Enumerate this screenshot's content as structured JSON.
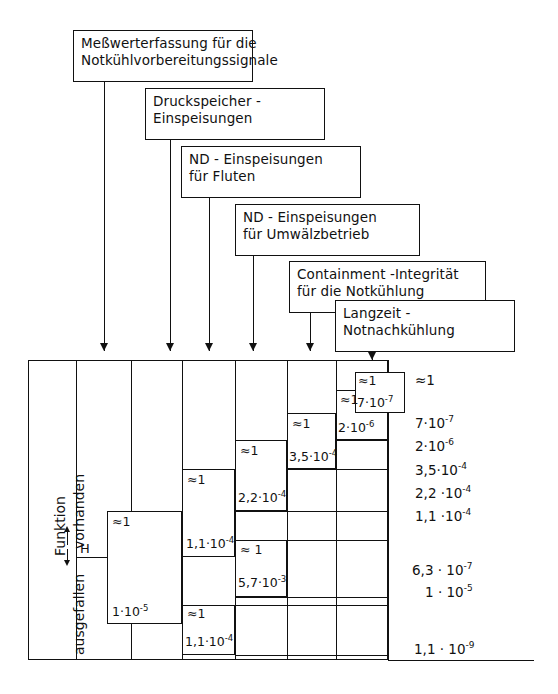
{
  "diagram": {
    "headers": [
      {
        "id": "messwerterfassung",
        "lines": [
          "Meßwerterfassung  für die",
          "Notkühlvorbereitungssignale"
        ]
      },
      {
        "id": "druckspeicher",
        "lines": [
          "Druckspeicher -",
          "Einspeisungen"
        ]
      },
      {
        "id": "nd-fluten",
        "lines": [
          "ND - Einspeisungen",
          "für  Fluten"
        ]
      },
      {
        "id": "nd-umwaelz",
        "lines": [
          "ND - Einspeisungen",
          "für  Umwälzbetrieb"
        ]
      },
      {
        "id": "containment",
        "lines": [
          "Containment -Integrität",
          "für  die  Notkühlung"
        ]
      },
      {
        "id": "langzeit",
        "lines": [
          "Langzeit -",
          "Notnachkühlung"
        ]
      }
    ],
    "axis_label": {
      "top_word": "Funktion",
      "up_word": "vorhanden",
      "down_word": "ausgefallen",
      "initiator": "H"
    },
    "branch_labels": [
      {
        "id": "b1-up",
        "text": "≈1"
      },
      {
        "id": "b1-down",
        "text": "1·10",
        "exp": "-5"
      },
      {
        "id": "b2-up",
        "text": "≈1"
      },
      {
        "id": "b2-down",
        "text": "1,1·10",
        "exp": "-4"
      },
      {
        "id": "b3-up",
        "text": "≈1"
      },
      {
        "id": "b3-down",
        "text": "2,2·10",
        "exp": "-4"
      },
      {
        "id": "b4-up",
        "text": "≈1"
      },
      {
        "id": "b4-down",
        "text": "3,5·10",
        "exp": "-4"
      },
      {
        "id": "b5-up",
        "text": "≈1"
      },
      {
        "id": "b5-down",
        "text": "2·10",
        "exp": "-6"
      },
      {
        "id": "b6-up",
        "text": "≈1"
      },
      {
        "id": "b6-down",
        "text": "7·10",
        "exp": "-7"
      },
      {
        "id": "b7-up",
        "text": "≈ 1"
      },
      {
        "id": "b7-down",
        "text": "5,7·10",
        "exp": "-3"
      },
      {
        "id": "b8-up",
        "text": "≈1"
      },
      {
        "id": "b8-down",
        "text": "1,1·10",
        "exp": "-4"
      }
    ],
    "outcomes": [
      {
        "id": "o1",
        "mant": "≈1",
        "exp": ""
      },
      {
        "id": "o2",
        "mant": "7·10",
        "exp": "-7"
      },
      {
        "id": "o3",
        "mant": "2·10",
        "exp": "-6"
      },
      {
        "id": "o4",
        "mant": "3,5·10",
        "exp": "-4"
      },
      {
        "id": "o5",
        "mant": "2,2 ·10",
        "exp": "-4"
      },
      {
        "id": "o6",
        "mant": "1,1 ·10",
        "exp": "-4"
      },
      {
        "id": "o7",
        "mant": "6,3 · 10",
        "exp": "-7"
      },
      {
        "id": "o8",
        "mant": "1 · 10",
        "exp": "-5"
      },
      {
        "id": "o9",
        "mant": "1,1 · 10",
        "exp": "-9"
      }
    ],
    "colors": {
      "ink": "#111111",
      "paper": "#ffffff"
    }
  }
}
